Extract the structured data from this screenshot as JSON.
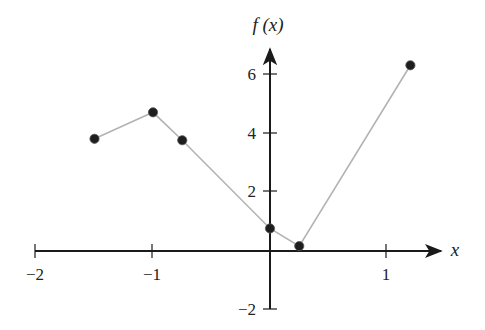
{
  "chart_data": {
    "type": "line",
    "title": "",
    "xlabel": "x",
    "ylabel": "f (x)",
    "xlim": [
      -2,
      1.4
    ],
    "ylim": [
      -2,
      7
    ],
    "grid": false,
    "legend": null,
    "x_ticks": [
      -2,
      -1,
      0,
      1
    ],
    "x_tick_labels": [
      "−2",
      "−1",
      "",
      "1"
    ],
    "y_ticks": [
      -2,
      2,
      4,
      6
    ],
    "y_tick_labels": [
      "−2",
      "2",
      "4",
      "6"
    ],
    "series": [
      {
        "name": "f(x)",
        "x": [
          -1.5,
          -1.0,
          -0.75,
          0.0,
          0.25,
          1.2
        ],
        "y": [
          3.8,
          4.7,
          3.75,
          0.75,
          0.15,
          6.3
        ],
        "marker": "filled-circle",
        "line_color": "#b3b3b3",
        "marker_color": "#1e1e1e"
      }
    ]
  },
  "labels": {
    "x_axis": "x",
    "y_axis": "f (x)",
    "x_ticks": {
      "neg2": "−2",
      "neg1": "−1",
      "pos1": "1"
    },
    "y_ticks": {
      "neg2": "−2",
      "pos2": "2",
      "pos4": "4",
      "pos6": "6"
    }
  }
}
